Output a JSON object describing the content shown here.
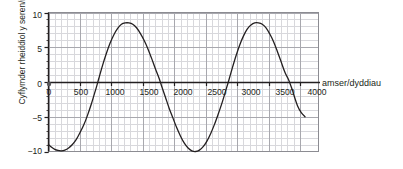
{
  "chart_data": {
    "type": "line",
    "title": "",
    "subtitle": "",
    "xlabel": "amser/dyddiau",
    "ylabel": "Cyflymder rheiddiol y seren/m s",
    "ylabel_exponent": "-1",
    "xlim": [
      0,
      4200
    ],
    "ylim": [
      -10,
      10
    ],
    "xticks": [
      0,
      500,
      1000,
      1500,
      2000,
      2500,
      3000,
      3500,
      4000
    ],
    "xtick_labels": [
      "0",
      "500",
      "1000",
      "1500",
      "2000",
      "2500",
      "3000",
      "3500",
      "4000"
    ],
    "yticks": [
      -10,
      -5,
      0,
      5,
      10
    ],
    "ytick_labels": [
      "−10",
      "−5",
      "0",
      "5",
      "10"
    ],
    "grid": true,
    "grid_minor_step_x": 100,
    "grid_minor_step_y": 1,
    "grid_major_step_x": 500,
    "grid_major_step_y": 5,
    "legend": "none",
    "series": [
      {
        "name": "Cyflymder rheiddiol y seren",
        "amplitude": 9.5,
        "period": 2100,
        "phase_min_x": 205,
        "points": [
          [
            0,
            -9.0
          ],
          [
            50,
            -9.4
          ],
          [
            100,
            -9.7
          ],
          [
            150,
            -9.85
          ],
          [
            205,
            -9.9
          ],
          [
            260,
            -9.8
          ],
          [
            320,
            -9.5
          ],
          [
            380,
            -9.0
          ],
          [
            440,
            -8.3
          ],
          [
            500,
            -7.3
          ],
          [
            560,
            -6.2
          ],
          [
            620,
            -4.8
          ],
          [
            680,
            -3.2
          ],
          [
            720,
            -2.0
          ],
          [
            760,
            -0.8
          ],
          [
            800,
            0.5
          ],
          [
            860,
            2.4
          ],
          [
            920,
            4.1
          ],
          [
            980,
            5.6
          ],
          [
            1040,
            6.8
          ],
          [
            1100,
            7.7
          ],
          [
            1160,
            8.3
          ],
          [
            1220,
            8.5
          ],
          [
            1280,
            8.5
          ],
          [
            1340,
            8.3
          ],
          [
            1400,
            7.8
          ],
          [
            1460,
            7.0
          ],
          [
            1520,
            6.0
          ],
          [
            1580,
            4.8
          ],
          [
            1640,
            3.4
          ],
          [
            1700,
            1.9
          ],
          [
            1760,
            0.5
          ],
          [
            1800,
            -0.6
          ],
          [
            1860,
            -2.2
          ],
          [
            1920,
            -3.8
          ],
          [
            1980,
            -5.2
          ],
          [
            2040,
            -6.6
          ],
          [
            2100,
            -7.8
          ],
          [
            2160,
            -8.8
          ],
          [
            2220,
            -9.5
          ],
          [
            2280,
            -9.9
          ],
          [
            2340,
            -10.0
          ],
          [
            2400,
            -9.8
          ],
          [
            2460,
            -9.3
          ],
          [
            2520,
            -8.5
          ],
          [
            2580,
            -7.4
          ],
          [
            2640,
            -6.1
          ],
          [
            2700,
            -4.6
          ],
          [
            2760,
            -3.0
          ],
          [
            2820,
            -1.2
          ],
          [
            2860,
            0.0
          ],
          [
            2920,
            1.9
          ],
          [
            2980,
            3.7
          ],
          [
            3040,
            5.3
          ],
          [
            3100,
            6.6
          ],
          [
            3160,
            7.6
          ],
          [
            3220,
            8.2
          ],
          [
            3280,
            8.5
          ],
          [
            3340,
            8.5
          ],
          [
            3400,
            8.3
          ],
          [
            3460,
            7.8
          ],
          [
            3520,
            6.9
          ],
          [
            3580,
            5.8
          ],
          [
            3640,
            4.4
          ],
          [
            3700,
            2.9
          ],
          [
            3760,
            1.4
          ],
          [
            3820,
            0.3
          ],
          [
            3880,
            -1.2
          ],
          [
            3900,
            -1.8
          ],
          [
            3960,
            -3.4
          ],
          [
            4020,
            -4.4
          ],
          [
            4080,
            -5.0
          ]
        ],
        "color": "#231f20",
        "linewidth": 1.3
      }
    ],
    "key_features": {
      "minima_x": [
        205,
        2340
      ],
      "minima_y": [
        -9.9,
        -10.0
      ],
      "maxima_x": [
        1280,
        3350
      ],
      "maxima_y": [
        8.5,
        8.5
      ],
      "zero_crossings_x": [
        790,
        1790,
        2860,
        3830
      ],
      "value_at_0": -9.0,
      "value_at_4000": -4.2
    }
  },
  "colors": {
    "axis": "#231f20",
    "grid_minor": "#d8d8dc",
    "grid_major": "#a8a8ae",
    "plot_border": "#8c8c92",
    "curve": "#231f20",
    "background": "#ffffff",
    "cut_text": "#c9c9cf"
  },
  "top_cut_text": ""
}
